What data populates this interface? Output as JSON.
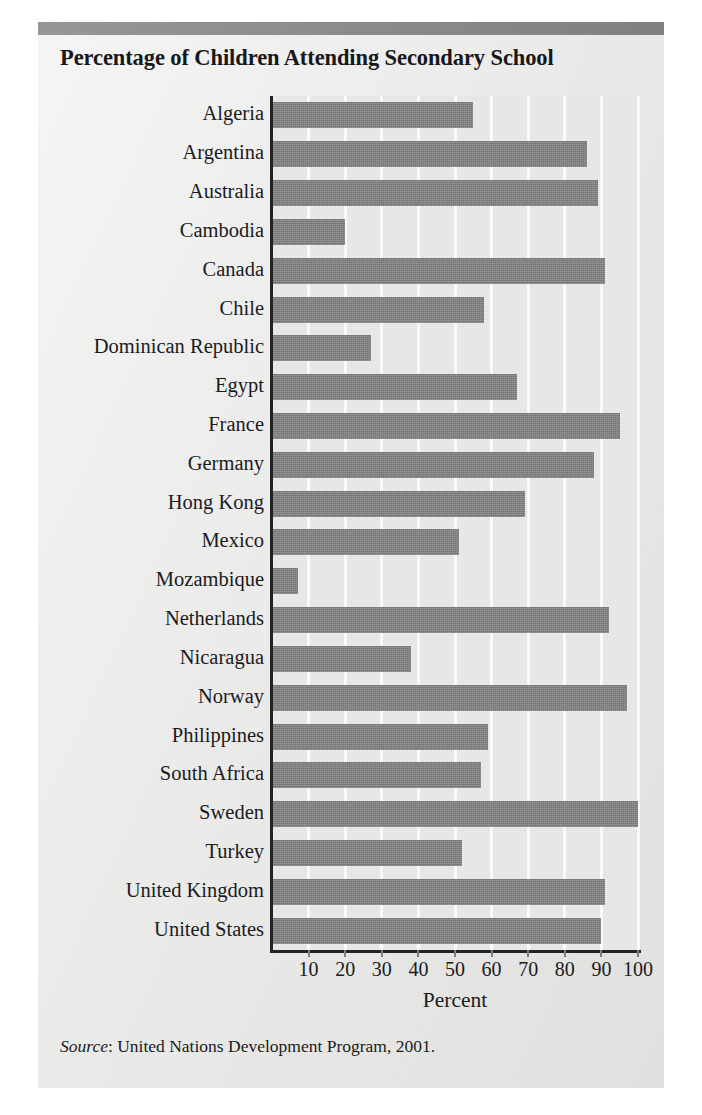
{
  "chart_data": {
    "type": "bar",
    "orientation": "horizontal",
    "title": "Percentage of Children Attending Secondary School",
    "xlabel": "Percent",
    "ylabel": "",
    "xlim": [
      0,
      100
    ],
    "xticks": [
      10,
      20,
      30,
      40,
      50,
      60,
      70,
      80,
      90,
      100
    ],
    "xtick_labels": [
      "10",
      "20",
      "30",
      "40",
      "50",
      "60",
      "70",
      "80",
      "90",
      "100"
    ],
    "grid": true,
    "grid_axis": "x",
    "legend": null,
    "bar_color": "#7f7f7f",
    "plot_background": "#e7e7e6",
    "categories": [
      "Algeria",
      "Argentina",
      "Australia",
      "Cambodia",
      "Canada",
      "Chile",
      "Dominican Republic",
      "Egypt",
      "France",
      "Germany",
      "Hong Kong",
      "Mexico",
      "Mozambique",
      "Netherlands",
      "Nicaragua",
      "Norway",
      "Philippines",
      "South Africa",
      "Sweden",
      "Turkey",
      "United Kingdom",
      "United States"
    ],
    "values": [
      55,
      86,
      89,
      20,
      91,
      58,
      27,
      67,
      95,
      88,
      69,
      51,
      7,
      92,
      38,
      97,
      59,
      57,
      100,
      52,
      91,
      90
    ]
  },
  "header": {
    "title": "Percentage of Children Attending Secondary School"
  },
  "footer": {
    "source_label": "Source",
    "source_separator": ": ",
    "source_text": "United Nations Development Program, 2001."
  },
  "colors": {
    "bar": "#7f7f7f",
    "top_rule": "#8a8a8a",
    "page": "#ececeb",
    "plot": "#e7e7e6",
    "gridline": "#fafafa",
    "axis": "#232323",
    "text": "#1b1b1d"
  }
}
